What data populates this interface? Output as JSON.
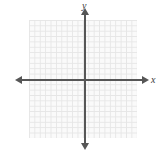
{
  "figure": {
    "type": "coordinate-plane",
    "title": "",
    "background_color": "#ffffff",
    "width": 162,
    "height": 158
  },
  "axes": {
    "x_label": "x",
    "y_label": "y",
    "axis_color": "#565656",
    "x_arrow_left": "arrow-left",
    "x_arrow_right": "arrow-right",
    "y_arrow_up": "arrow-up",
    "y_arrow_down": "arrow-down"
  },
  "grid": {
    "color": "#e6e6e6",
    "fill_color": "#fafafa",
    "cell_size_px": 5.4,
    "columns": 20,
    "rows": 22,
    "visible": true
  },
  "chart_data": {
    "type": "scatter",
    "title": "",
    "subtitle": "",
    "xlabel": "x",
    "ylabel": "y",
    "xticklabels": [],
    "yticklabels": [],
    "xlim": [
      -10,
      10
    ],
    "ylim": [
      -11,
      11
    ],
    "grid": true,
    "legend": null,
    "annotations": [],
    "series": [
      {
        "name": "",
        "x": [],
        "y": []
      }
    ],
    "note": "Empty coordinate plane — no data plotted, no numeric tick labels shown."
  }
}
